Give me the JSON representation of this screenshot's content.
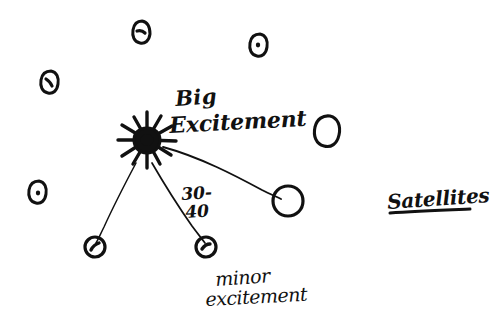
{
  "canvas": {
    "width": 494,
    "height": 330,
    "background_color": "#ffffff",
    "ink_color": "#111111",
    "medium": "hand-drawn ink sketch"
  },
  "annotations": {
    "big_label_line1": "Big",
    "big_label_line2": "Excitement",
    "range_line1": "30-",
    "range_line2": "40",
    "minor_label_line1": "minor",
    "minor_label_line2": "excitement",
    "legend_label": "Satellites"
  },
  "diagram": {
    "hub": {
      "name": "starburst-hub",
      "cx": 147,
      "cy": 140,
      "core_radius": 9,
      "spike_count": 12,
      "spike_length": 23
    },
    "connected_nodes": [
      {
        "id": "node-right",
        "cx": 288,
        "cy": 201,
        "rx": 15,
        "ry": 15,
        "has_dot": false
      },
      {
        "id": "node-lower-mid",
        "cx": 206,
        "cy": 247,
        "rx": 10,
        "ry": 10,
        "has_dot": true
      },
      {
        "id": "node-lower-left",
        "cx": 95,
        "cy": 247,
        "rx": 10,
        "ry": 10,
        "has_dot": true
      }
    ],
    "free_nodes": [
      {
        "id": "node-top-mid",
        "cx": 141,
        "cy": 32,
        "rx": 9,
        "ry": 11,
        "has_dot": true
      },
      {
        "id": "node-top-right",
        "cx": 259,
        "cy": 45,
        "rx": 9,
        "ry": 11,
        "has_dot": true
      },
      {
        "id": "node-left-upper",
        "cx": 50,
        "cy": 82,
        "rx": 9,
        "ry": 11,
        "has_dot": true
      },
      {
        "id": "node-left-lower",
        "cx": 38,
        "cy": 192,
        "rx": 9,
        "ry": 11,
        "has_dot": true
      },
      {
        "id": "node-right-upper",
        "cx": 328,
        "cy": 130,
        "rx": 12,
        "ry": 14,
        "has_dot": false
      }
    ],
    "connections": [
      {
        "id": "link-hub-right",
        "from": "starburst-hub",
        "to": "node-right"
      },
      {
        "id": "link-hub-lower-mid",
        "from": "starburst-hub",
        "to": "node-lower-mid"
      },
      {
        "id": "link-hub-lower-left",
        "from": "starburst-hub",
        "to": "node-lower-left"
      }
    ],
    "legend_underline": {
      "x1": 390,
      "y1": 212,
      "x2": 470,
      "y2": 210
    }
  }
}
